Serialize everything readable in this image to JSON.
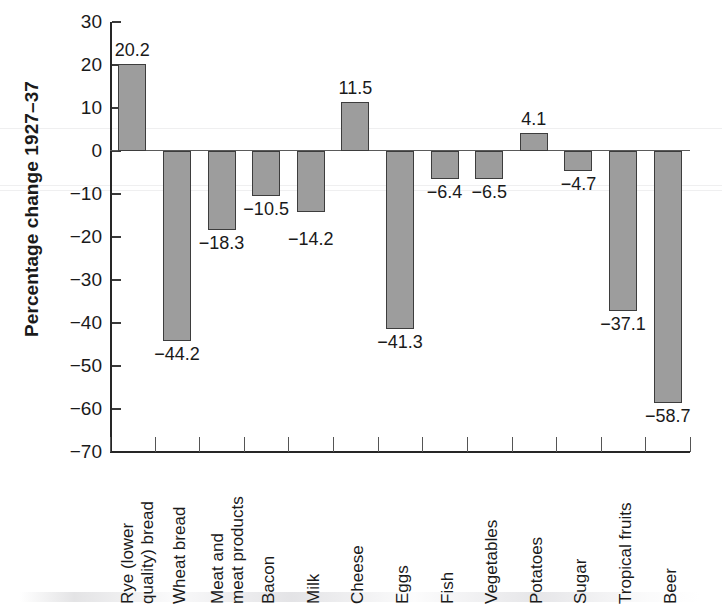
{
  "chart_data": {
    "type": "bar",
    "title": "",
    "subtitle": "",
    "xlabel": "",
    "ylabel": "Percentage change 1927–37",
    "ylim": [
      -70,
      30
    ],
    "ytick_step": 10,
    "grid": false,
    "legend": null,
    "orientation": "vertical",
    "baseline": 0,
    "categories": [
      "Rye (lower quality) bread",
      "Wheat bread",
      "Meat and meat products",
      "Bacon",
      "Milk",
      "Cheese",
      "Eggs",
      "Fish",
      "Vegetables",
      "Potatoes",
      "Sugar",
      "Tropical fruits",
      "Beer"
    ],
    "values": [
      20.2,
      -44.2,
      -18.3,
      -10.5,
      -14.2,
      11.5,
      -41.3,
      -6.4,
      -6.5,
      4.1,
      -4.7,
      -37.1,
      -58.7
    ],
    "data_labels": [
      "20.2",
      "−44.2",
      "−18.3",
      "−10.5",
      "−14.2",
      "11.5",
      "−41.3",
      "−6.4",
      "−6.5",
      "4.1",
      "−4.7",
      "−37.1",
      "−58.7"
    ],
    "ytick_labels": [
      "30",
      "20",
      "10",
      "0",
      "−10",
      "−20",
      "−30",
      "−40",
      "−50",
      "−60",
      "−70"
    ],
    "ytick_values": [
      30,
      20,
      10,
      0,
      -10,
      -20,
      -30,
      -40,
      -50,
      -60,
      -70
    ],
    "category_lines": [
      [
        "Rye (lower",
        "quality) bread"
      ],
      [
        "Wheat bread"
      ],
      [
        "Meat and",
        "meat products"
      ],
      [
        "Bacon"
      ],
      [
        "Milk"
      ],
      [
        "Cheese"
      ],
      [
        "Eggs"
      ],
      [
        "Fish"
      ],
      [
        "Vegetables"
      ],
      [
        "Potatoes"
      ],
      [
        "Sugar"
      ],
      [
        "Tropical fruits"
      ],
      [
        "Beer"
      ]
    ],
    "colors": {
      "bar_fill": "#9d9d9d",
      "bar_stroke": "#3d3d3d",
      "axis": "#262626",
      "text": "#1a1a1a",
      "background": "#ffffff"
    }
  }
}
